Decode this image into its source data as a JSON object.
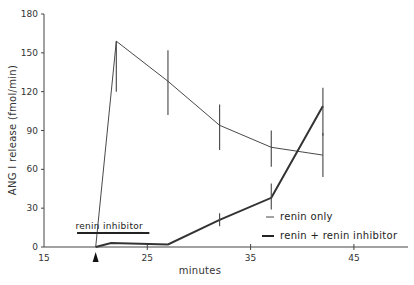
{
  "chart_data": {
    "type": "line",
    "title": "",
    "xlabel": "minutes",
    "ylabel": "ANG I release (fmol/min)",
    "xlim": [
      15,
      50
    ],
    "ylim": [
      0,
      180
    ],
    "x_ticks": [
      15,
      25,
      35,
      45
    ],
    "y_ticks": [
      0,
      30,
      60,
      90,
      120,
      150,
      180
    ],
    "grid": false,
    "legend_position": "lower right",
    "series": [
      {
        "name": "renin only",
        "line_style": "thin",
        "x": [
          20,
          22,
          27,
          32,
          37,
          42
        ],
        "values": [
          0,
          159,
          128,
          94,
          77,
          71
        ],
        "error": [
          null,
          [
            120,
            159
          ],
          [
            102,
            152
          ],
          [
            75,
            110
          ],
          [
            62,
            90
          ],
          [
            54,
            88
          ]
        ]
      },
      {
        "name": "renin + renin inhibitor",
        "line_style": "thick",
        "x": [
          20,
          21.5,
          27,
          32,
          37,
          42
        ],
        "values": [
          0,
          3,
          2,
          21,
          38,
          109
        ],
        "error": [
          null,
          null,
          null,
          [
            16,
            26
          ],
          [
            29,
            49
          ],
          [
            86,
            123
          ]
        ]
      }
    ],
    "annotations": [
      {
        "text": "renin inhibitor",
        "type": "bar",
        "x_start": 18.2,
        "x_end": 25.2,
        "y": 11
      },
      {
        "text": "",
        "type": "arrowhead",
        "x": 20,
        "position": "below x-axis"
      }
    ]
  },
  "labels": {
    "ylabel": "ANG I release (fmol/min)",
    "xlabel": "minutes",
    "inhibitor_bar": "renin inhibitor",
    "legend": [
      "renin only",
      "renin + renin inhibitor"
    ],
    "x_ticks": [
      "15",
      "25",
      "35",
      "45"
    ],
    "y_ticks": [
      "0",
      "30",
      "60",
      "90",
      "120",
      "150",
      "180"
    ]
  }
}
